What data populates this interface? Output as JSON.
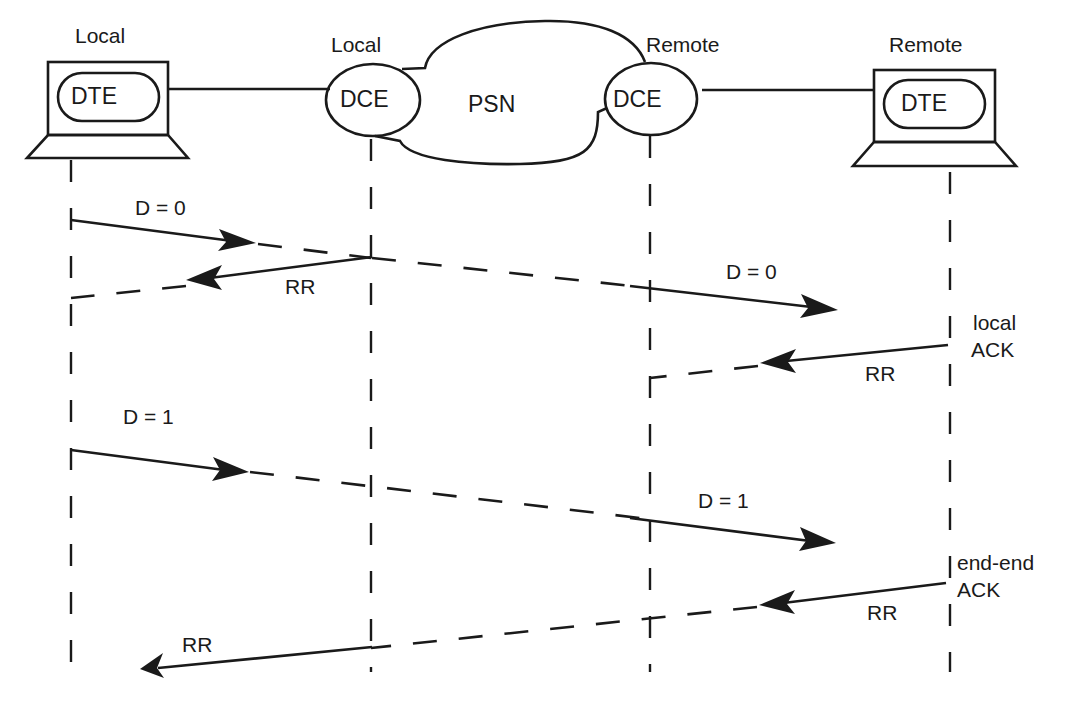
{
  "diagram": {
    "type": "sequence-diagram",
    "nodes": {
      "local_dte": {
        "caption": "Local",
        "label": "DTE"
      },
      "local_dce": {
        "caption": "Local",
        "label": "DCE"
      },
      "psn": {
        "label": "PSN"
      },
      "remote_dce": {
        "caption": "Remote",
        "label": "DCE"
      },
      "remote_dte": {
        "caption": "Remote",
        "label": "DTE"
      }
    },
    "messages": [
      {
        "label": "D = 0",
        "from": "Local DTE",
        "to": "Remote DTE"
      },
      {
        "label": "RR",
        "from": "Local DCE",
        "to": "Local DTE"
      },
      {
        "label": "D = 0",
        "from": "Local DTE",
        "to": "Remote DTE"
      },
      {
        "label": "RR",
        "from": "Remote DTE",
        "to": "Remote DCE"
      },
      {
        "label": "D = 1",
        "from": "Local DTE",
        "to": "Remote DTE"
      },
      {
        "label": "D = 1",
        "from": "Local DTE",
        "to": "Remote DTE"
      },
      {
        "label": "RR",
        "from": "Remote DTE",
        "to": "Local DTE"
      },
      {
        "label": "RR",
        "from": "Remote DTE",
        "to": "Local DTE"
      }
    ],
    "annotations": {
      "local_ack_line1": "local",
      "local_ack_line2": "ACK",
      "end_ack_line1": "end-end",
      "end_ack_line2": "ACK"
    },
    "colors": {
      "ink": "#1a1a1a",
      "background": "#ffffff"
    }
  }
}
